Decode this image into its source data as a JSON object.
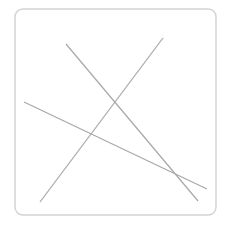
{
  "diagram": {
    "frame": {
      "x": 15,
      "y": 9,
      "width": 201,
      "height": 206,
      "radius": 8,
      "stroke": "#d4d4d4",
      "stroke_width": 1.5
    },
    "line_color": "#a8a8a8",
    "lines": [
      {
        "x1": 66,
        "y1": 44,
        "x2": 198,
        "y2": 201
      },
      {
        "x1": 163,
        "y1": 38,
        "x2": 40,
        "y2": 202
      },
      {
        "x1": 24,
        "y1": 102,
        "x2": 207,
        "y2": 189
      }
    ]
  }
}
